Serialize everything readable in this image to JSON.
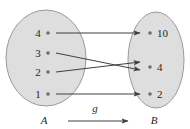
{
  "figure": {
    "type": "mapping-diagram",
    "background_color": "#ffffff",
    "ellipse_fill": "#dedede",
    "ellipse_stroke": "#9a9a9a",
    "line_color": "#3f3f3f",
    "text_color": "#231f20",
    "domain": {
      "name": "A",
      "label": "A",
      "elements": [
        {
          "value": "4",
          "dot_x": 48,
          "dot_y": 33,
          "label_x": 38,
          "label_y": 37
        },
        {
          "value": "3",
          "dot_x": 48,
          "dot_y": 53,
          "label_x": 38,
          "label_y": 57
        },
        {
          "value": "2",
          "dot_x": 48,
          "dot_y": 72,
          "label_x": 38,
          "label_y": 76
        },
        {
          "value": "1",
          "dot_x": 48,
          "dot_y": 94,
          "label_x": 38,
          "label_y": 98
        }
      ],
      "ellipse": {
        "cx": 46,
        "cy": 58,
        "rx": 40,
        "ry": 48
      },
      "label_x": 44,
      "label_y": 124
    },
    "codomain": {
      "name": "B",
      "label": "B",
      "elements": [
        {
          "value": "10",
          "dot_x": 150,
          "dot_y": 33,
          "label_x": 157,
          "label_y": 37
        },
        {
          "value": "4",
          "dot_x": 150,
          "dot_y": 67,
          "label_x": 157,
          "label_y": 71
        },
        {
          "value": "2",
          "dot_x": 150,
          "dot_y": 94,
          "label_x": 157,
          "label_y": 98
        }
      ],
      "ellipse": {
        "cx": 156,
        "cy": 60,
        "rx": 28,
        "ry": 48
      },
      "label_x": 154,
      "label_y": 124
    },
    "mappings": [
      {
        "from": "4",
        "to": "10",
        "x1": 56,
        "y1": 33,
        "x2": 140,
        "y2": 33
      },
      {
        "from": "3",
        "to": "4",
        "x1": 56,
        "y1": 53,
        "x2": 140,
        "y2": 70
      },
      {
        "from": "2",
        "to": "4",
        "x1": 56,
        "y1": 72,
        "x2": 140,
        "y2": 62
      },
      {
        "from": "1",
        "to": "2",
        "x1": 56,
        "y1": 94,
        "x2": 140,
        "y2": 94
      }
    ],
    "function_arrow": {
      "label": "g",
      "label_x": 95,
      "label_y": 112,
      "x1": 68,
      "y1": 121,
      "x2": 128,
      "y2": 121
    }
  }
}
